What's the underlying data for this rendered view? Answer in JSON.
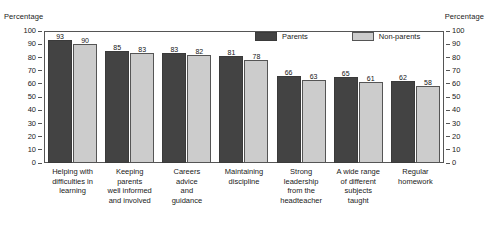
{
  "axes": {
    "left_caption": "Percentage",
    "right_caption": "Percentage",
    "ticks": [
      0,
      10,
      20,
      30,
      40,
      50,
      60,
      70,
      80,
      90,
      100
    ]
  },
  "legend": {
    "items": [
      {
        "label": "Parents",
        "color": "#434343"
      },
      {
        "label": "Non-parents",
        "color": "#cccccc"
      }
    ]
  },
  "chart_data": {
    "type": "bar",
    "title": "",
    "xlabel": "",
    "ylabel": "Percentage",
    "ylim": [
      0,
      100
    ],
    "ytick_step": 10,
    "grid": false,
    "legend_position": "top-center",
    "categories": [
      "Helping with difficulties in learning",
      "Keeping parents well informed and involved",
      "Careers advice and guidance",
      "Maintaining discipline",
      "Strong leadership from the headteacher",
      "A wide range of different subjects taught",
      "Regular homework"
    ],
    "category_lines": [
      [
        "Helping with",
        "difficulties in",
        "learning"
      ],
      [
        "Keeping",
        "parents",
        "well informed",
        "and involved"
      ],
      [
        "Careers",
        "advice",
        "and",
        "guidance"
      ],
      [
        "Maintaining",
        "discipline"
      ],
      [
        "Strong",
        "leadership",
        "from the",
        "headteacher"
      ],
      [
        "A wide range",
        "of different",
        "subjects",
        "taught"
      ],
      [
        "Regular",
        "homework"
      ]
    ],
    "series": [
      {
        "name": "Parents",
        "color": "#434343",
        "values": [
          93,
          85,
          83,
          81,
          66,
          65,
          62
        ]
      },
      {
        "name": "Non-parents",
        "color": "#cccccc",
        "values": [
          90,
          83,
          82,
          78,
          63,
          61,
          58
        ]
      }
    ]
  }
}
